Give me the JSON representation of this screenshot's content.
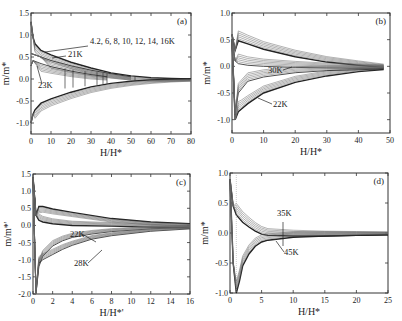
{
  "chart_data": [
    {
      "panel": "(a)",
      "type": "line",
      "title": "",
      "xlabel": "H/H*",
      "ylabel": "m/m*",
      "xlim": [
        0,
        80
      ],
      "ylim": [
        -1.25,
        1.5
      ],
      "xticks": [
        0,
        10,
        20,
        30,
        40,
        50,
        60,
        70,
        80
      ],
      "yticks": [
        -1.0,
        -0.5,
        0.0,
        0.5,
        1.0,
        1.5
      ],
      "grid": false,
      "annotations": [
        "4.2, 6, 8, 10, 12, 14, 16K",
        "21K",
        "23K"
      ],
      "series": [
        {
          "name": "4.2-16K upper",
          "x": [
            0,
            1,
            2,
            5,
            10,
            20,
            30,
            40,
            50,
            60,
            70,
            80
          ],
          "y": [
            1.3,
            0.95,
            0.8,
            0.65,
            0.55,
            0.38,
            0.25,
            0.14,
            0.07,
            0.03,
            0.01,
            0.0
          ]
        },
        {
          "name": "4.2-16K lower",
          "x": [
            0,
            1,
            2,
            5,
            10,
            20,
            30,
            40,
            50,
            60,
            70,
            80
          ],
          "y": [
            -1.0,
            -0.8,
            -0.7,
            -0.55,
            -0.45,
            -0.3,
            -0.18,
            -0.1,
            -0.05,
            -0.02,
            -0.005,
            0.0
          ]
        },
        {
          "name": "21K upper",
          "x": [
            0,
            5,
            10,
            20,
            30,
            40,
            50
          ],
          "y": [
            0.58,
            0.5,
            0.42,
            0.3,
            0.2,
            0.12,
            0.05
          ]
        },
        {
          "name": "23K upper",
          "x": [
            0,
            1,
            5,
            10,
            20,
            30,
            38
          ],
          "y": [
            0.3,
            0.42,
            0.35,
            0.28,
            0.18,
            0.1,
            0.05
          ]
        },
        {
          "name": "minor loop closures",
          "x": [
            17,
            21,
            27,
            33,
            36,
            38,
            52
          ],
          "y": [
            0.0,
            0.0,
            0.0,
            0.0,
            0.0,
            0.0,
            0.0
          ]
        }
      ]
    },
    {
      "panel": "(b)",
      "type": "line",
      "title": "",
      "xlabel": "H/H*",
      "ylabel": "m/m*",
      "xlim": [
        0,
        50
      ],
      "ylim": [
        -1.25,
        1.0
      ],
      "xticks": [
        0,
        10,
        20,
        30,
        40,
        50
      ],
      "yticks": [
        -1.0,
        -0.5,
        0.0,
        0.5,
        1.0
      ],
      "grid": false,
      "annotations": [
        "30K",
        "22K"
      ],
      "series": [
        {
          "name": "22K upper",
          "x": [
            0,
            1,
            2,
            5,
            10,
            20,
            30,
            40,
            48
          ],
          "y": [
            0.6,
            0.3,
            0.48,
            0.42,
            0.32,
            0.18,
            0.08,
            0.02,
            -0.02
          ]
        },
        {
          "name": "22K lower",
          "x": [
            0,
            1,
            2,
            3,
            5,
            10,
            20,
            30,
            40,
            48
          ],
          "y": [
            0.5,
            -1.0,
            -0.85,
            -0.8,
            -0.7,
            -0.5,
            -0.3,
            -0.18,
            -0.1,
            -0.06
          ]
        },
        {
          "name": "30K upper",
          "x": [
            0,
            1,
            2,
            5,
            10,
            20,
            30,
            48
          ],
          "y": [
            0.5,
            0.1,
            0.05,
            0.02,
            0.0,
            -0.02,
            -0.03,
            -0.04
          ]
        },
        {
          "name": "30K lower",
          "x": [
            0,
            1,
            2,
            5,
            10,
            20,
            30,
            48
          ],
          "y": [
            0.5,
            -0.9,
            -0.5,
            -0.28,
            -0.2,
            -0.12,
            -0.08,
            -0.05
          ]
        }
      ]
    },
    {
      "panel": "(c)",
      "type": "line",
      "title": "",
      "xlabel": "H/H*'",
      "ylabel": "m/m*'",
      "xlim": [
        0,
        16
      ],
      "ylim": [
        -2.0,
        1.5
      ],
      "xticks": [
        0,
        2,
        4,
        6,
        8,
        10,
        12,
        14,
        16
      ],
      "yticks": [
        -2.0,
        -1.5,
        -1.0,
        -0.5,
        0.0,
        0.5,
        1.0,
        1.5
      ],
      "grid": false,
      "annotations": [
        "22K",
        "28K"
      ],
      "series": [
        {
          "name": "upper outer",
          "x": [
            0,
            0.3,
            0.6,
            1,
            2,
            4,
            8,
            12,
            16
          ],
          "y": [
            1.4,
            0.3,
            0.55,
            0.55,
            0.48,
            0.38,
            0.2,
            0.1,
            0.05
          ]
        },
        {
          "name": "upper inner",
          "x": [
            0,
            0.3,
            0.6,
            1,
            2,
            4,
            8,
            12,
            16
          ],
          "y": [
            1.4,
            0.3,
            0.15,
            0.1,
            0.05,
            0.0,
            -0.02,
            -0.05,
            -0.08
          ]
        },
        {
          "name": "22K lower",
          "x": [
            0,
            0.3,
            0.6,
            1,
            2,
            3,
            4,
            6,
            8,
            12,
            16
          ],
          "y": [
            1.4,
            -2.0,
            -1.2,
            -0.9,
            -0.6,
            -0.45,
            -0.35,
            -0.25,
            -0.18,
            -0.1,
            -0.05
          ]
        },
        {
          "name": "28K lower",
          "x": [
            0,
            0.3,
            0.6,
            1,
            2,
            3,
            4,
            6,
            8,
            12,
            16
          ],
          "y": [
            1.4,
            -1.9,
            -1.1,
            -1.0,
            -0.85,
            -0.7,
            -0.58,
            -0.4,
            -0.3,
            -0.17,
            -0.1
          ]
        }
      ]
    },
    {
      "panel": "(d)",
      "type": "line",
      "title": "",
      "xlabel": "H/H*",
      "ylabel": "m/m*",
      "xlim": [
        0,
        25
      ],
      "ylim": [
        -1.0,
        1.0
      ],
      "xticks": [
        0,
        5,
        10,
        15,
        20,
        25
      ],
      "yticks": [
        -1.0,
        -0.5,
        0.0,
        0.5,
        1.0
      ],
      "grid": false,
      "annotations": [
        "35K",
        "45K"
      ],
      "series": [
        {
          "name": "upper",
          "x": [
            0,
            0.5,
            1,
            2,
            3,
            4,
            5,
            6,
            10,
            15,
            20,
            25
          ],
          "y": [
            0.9,
            0.45,
            0.3,
            0.18,
            0.1,
            0.03,
            -0.02,
            -0.04,
            -0.05,
            -0.05,
            -0.04,
            -0.03
          ]
        },
        {
          "name": "lower",
          "x": [
            0,
            0.5,
            1,
            1.5,
            2,
            3,
            4,
            5,
            6,
            10,
            15,
            20,
            25
          ],
          "y": [
            0.9,
            -0.5,
            -1.0,
            -0.8,
            -0.55,
            -0.35,
            -0.22,
            -0.15,
            -0.12,
            -0.07,
            -0.05,
            -0.04,
            -0.03
          ]
        }
      ]
    }
  ]
}
